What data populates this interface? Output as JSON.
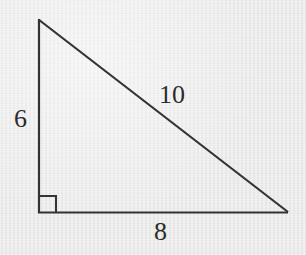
{
  "figure": {
    "type": "geometry-diagram",
    "shape": "right-triangle",
    "background_color": "#e9e9e9",
    "stroke_color": "#333333",
    "text_color": "#2b2b2b",
    "stroke_width": 2,
    "canvas": {
      "width": 306,
      "height": 255
    },
    "vertices": {
      "apex_top_left": {
        "name": "apex",
        "x": 38,
        "y": 19
      },
      "right_angle": {
        "name": "right-angle-vertex",
        "x": 39,
        "y": 213
      },
      "bottom_right": {
        "name": "bottom-right-vertex",
        "x": 288,
        "y": 212
      }
    },
    "right_angle_marker": {
      "name": "right-angle-square",
      "x": 39,
      "y": 196,
      "size": 17,
      "meaning": "90 degrees"
    },
    "sides": [
      {
        "id": "vertical-leg",
        "role": "leg",
        "label": "6",
        "value": 6,
        "label_x": 14,
        "label_y": 106
      },
      {
        "id": "hypotenuse",
        "role": "hypotenuse",
        "label": "10",
        "value": 10,
        "label_x": 159,
        "label_y": 82
      },
      {
        "id": "horizontal-leg",
        "role": "leg",
        "label": "8",
        "value": 8,
        "label_x": 154,
        "label_y": 219
      }
    ],
    "labels": {
      "vertical_leg": "6",
      "hypotenuse": "10",
      "horizontal_leg": "8"
    }
  }
}
